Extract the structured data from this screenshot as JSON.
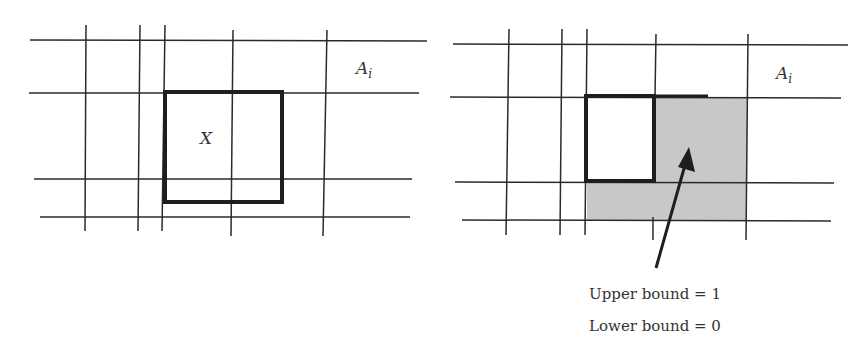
{
  "left_panel": {
    "region_label": "A",
    "region_subscript": "i",
    "box_label": "X"
  },
  "right_panel": {
    "region_label": "A",
    "region_subscript": "i",
    "annotation": {
      "upper": "Upper bound = 1",
      "lower": "Lower bound = 0"
    }
  },
  "colors": {
    "line": "#2a2a2a",
    "box": "#1e1e1e",
    "shade": "#c8c8c8",
    "text": "#333333"
  }
}
